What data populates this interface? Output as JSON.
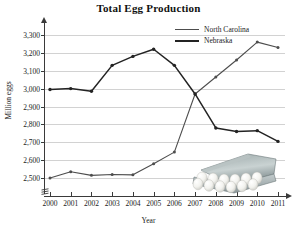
{
  "chart_data": {
    "type": "line",
    "title": "Total Egg Production",
    "xlabel": "Year",
    "ylabel": "Million eggs",
    "categories": [
      "2000",
      "2001",
      "2002",
      "2003",
      "2004",
      "2005",
      "2006",
      "2007",
      "2008",
      "2009",
      "2010",
      "2011"
    ],
    "x": [
      2000,
      2001,
      2002,
      2003,
      2004,
      2005,
      2006,
      2007,
      2008,
      2009,
      2010,
      2011
    ],
    "ylim": [
      2450,
      3350
    ],
    "yticks": [
      "2,500",
      "2,600",
      "2,700",
      "2,800",
      "2,900",
      "3,000",
      "3,100",
      "3,200",
      "3,300"
    ],
    "ytick_values": [
      2500,
      2600,
      2700,
      2800,
      2900,
      3000,
      3100,
      3200,
      3300
    ],
    "grid": true,
    "axis_break": true,
    "legend_position": "top-right",
    "series": [
      {
        "name": "North Carolina",
        "color": "#4d4d4d",
        "values": [
          2500,
          2535,
          2515,
          2520,
          2518,
          2580,
          2645,
          2970,
          3065,
          3160,
          3260,
          3230
        ]
      },
      {
        "name": "Nebraska",
        "color": "#232323",
        "values": [
          2995,
          3000,
          2985,
          3130,
          3180,
          3220,
          3130,
          2970,
          2780,
          2760,
          2765,
          2705
        ]
      }
    ],
    "annotations": [
      {
        "name": "egg-carton-photo",
        "description": "photograph of an open carton of white eggs"
      }
    ]
  }
}
